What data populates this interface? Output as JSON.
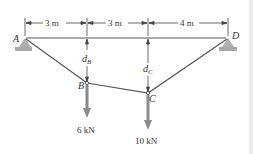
{
  "diagram": {
    "points": {
      "A": {
        "label": "A"
      },
      "B": {
        "label": "B"
      },
      "C": {
        "label": "C"
      },
      "D": {
        "label": "D"
      }
    },
    "dimensions": {
      "AB_span": "3 m",
      "BC_span": "3 m",
      "CD_span": "4 m"
    },
    "sags": {
      "dB": {
        "main": "d",
        "sub": "B"
      },
      "dC": {
        "main": "d",
        "sub": "C"
      }
    },
    "loads": {
      "B": "6 kN",
      "C": "10 kN"
    },
    "colors": {
      "cable": "#555555",
      "load_arrow": "#8a8a8a",
      "support": "#a8a8a8"
    }
  }
}
